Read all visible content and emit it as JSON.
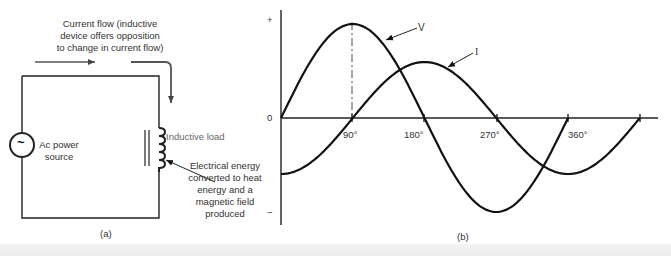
{
  "figure_a": {
    "caption": "(a)",
    "current_flow_label": [
      "Current flow (inductive",
      "device offers opposition",
      "to change in current flow)"
    ],
    "source_label": [
      "Ac power",
      "source"
    ],
    "source_symbol": "~",
    "load_label": "Inductive load",
    "energy_label": [
      "Electrical energy",
      "converted to heat",
      "energy and a",
      "magnetic field",
      "produced"
    ]
  },
  "figure_b": {
    "caption": "(b)",
    "y_plus": "+",
    "y_zero": "0",
    "y_minus": "−",
    "x_ticks": [
      "90°",
      "180°",
      "270°",
      "360°"
    ],
    "v_label": "V",
    "i_label": "I"
  },
  "chart_data": {
    "type": "line",
    "title": "",
    "xlabel": "Phase angle (degrees)",
    "ylabel": "",
    "x": [
      0,
      45,
      90,
      135,
      180,
      225,
      270,
      315,
      360,
      405,
      450
    ],
    "series": [
      {
        "name": "V",
        "values": [
          0,
          0.71,
          1,
          0.71,
          0,
          -0.71,
          -1,
          -0.71,
          0,
          0.71,
          1
        ]
      },
      {
        "name": "I",
        "values": [
          -0.6,
          -0.42,
          0,
          0.42,
          0.6,
          0.42,
          0,
          -0.42,
          -0.6,
          -0.42,
          0
        ]
      }
    ],
    "x_tick_labels": [
      "90°",
      "180°",
      "270°",
      "360°"
    ],
    "y_tick_labels": [
      "+",
      "0",
      "−"
    ],
    "annotation": "Current (I) lags voltage (V) by 90°",
    "grid": false,
    "legend": "arrow labels V and I"
  }
}
